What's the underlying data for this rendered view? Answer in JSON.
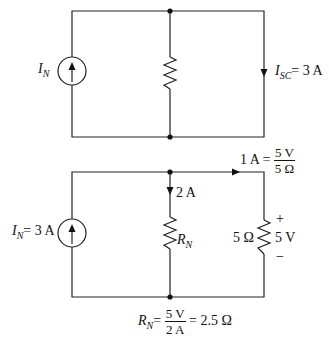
{
  "figure": {
    "top_circuit": {
      "source_label_main": "I",
      "source_label_sub": "N",
      "isc_label_main": "I",
      "isc_label_sub": "SC",
      "isc_value": "= 3 A"
    },
    "bottom_circuit": {
      "source_label_main": "I",
      "source_label_sub": "N",
      "source_value": "= 3 A",
      "branch_current": "2 A",
      "rn_label_main": "R",
      "rn_label_sub": "N",
      "load_current_lhs": "1 A =",
      "load_current_num": "5 V",
      "load_current_den": "5 Ω",
      "load_resistance": "5 Ω",
      "plus_sign": "+",
      "load_voltage": "5 V",
      "minus_sign": "−"
    },
    "equation": {
      "lhs_main": "R",
      "lhs_sub": "N",
      "eq1": "=",
      "num": "5 V",
      "den": "2 A",
      "result": "= 2.5 Ω"
    }
  }
}
